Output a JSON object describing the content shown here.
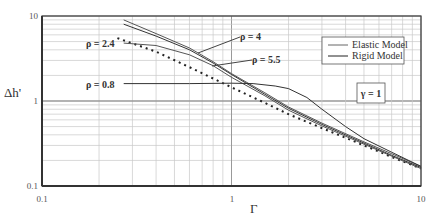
{
  "chart_data": {
    "type": "line",
    "title": "",
    "xlabel": "Γ",
    "ylabel": "Δh'",
    "xscale": "log",
    "yscale": "log",
    "xlim": [
      0.1,
      10
    ],
    "ylim": [
      0.1,
      10
    ],
    "grid": true,
    "x_ticks": [
      "0.1",
      "1",
      "10"
    ],
    "y_ticks": [
      "0.1",
      "1",
      "10"
    ],
    "legend": {
      "position": "upper right",
      "entries": [
        "Elastic Model",
        "Rigid Model"
      ]
    },
    "annotations": [
      "ρ = 4",
      "ρ = 5.5",
      "ρ = 2.4",
      "ρ = 0.8",
      "γ = 1"
    ],
    "series": [
      {
        "name": "Rigid Model",
        "style": "dotted",
        "x": [
          0.25,
          0.4,
          0.6,
          1.0,
          1.5,
          2.0,
          3.0,
          5.0,
          7.0,
          10.0
        ],
        "y": [
          5.5,
          3.8,
          2.5,
          1.45,
          0.95,
          0.7,
          0.48,
          0.3,
          0.22,
          0.16
        ]
      },
      {
        "name": "Elastic Model ρ = 5.5",
        "style": "solid",
        "x": [
          0.27,
          0.4,
          0.6,
          0.8,
          1.0,
          1.5,
          2.0,
          3.0,
          5.0,
          7.0,
          10.0
        ],
        "y": [
          9.0,
          6.2,
          4.2,
          2.9,
          2.1,
          1.25,
          0.85,
          0.55,
          0.33,
          0.24,
          0.17
        ]
      },
      {
        "name": "Elastic Model ρ = 4",
        "style": "solid",
        "x": [
          0.27,
          0.4,
          0.6,
          0.8,
          1.0,
          1.5,
          2.0,
          3.0,
          5.0,
          7.0,
          10.0
        ],
        "y": [
          8.0,
          5.8,
          4.0,
          2.8,
          2.05,
          1.2,
          0.82,
          0.53,
          0.32,
          0.23,
          0.165
        ]
      },
      {
        "name": "Elastic Model ρ = 2.4",
        "style": "solid",
        "x": [
          0.27,
          0.4,
          0.6,
          0.8,
          1.0,
          1.5,
          2.0,
          3.0,
          5.0,
          7.0,
          10.0
        ],
        "y": [
          4.8,
          4.5,
          3.5,
          2.6,
          1.9,
          1.15,
          0.78,
          0.51,
          0.31,
          0.225,
          0.16
        ]
      },
      {
        "name": "Elastic Model ρ = 0.8",
        "style": "solid",
        "x": [
          0.27,
          0.6,
          1.0,
          1.3,
          1.7,
          2.0,
          2.5,
          3.0,
          4.0,
          5.0,
          7.0,
          10.0
        ],
        "y": [
          1.6,
          1.6,
          1.62,
          1.6,
          1.5,
          1.4,
          1.1,
          0.8,
          0.5,
          0.36,
          0.25,
          0.17
        ]
      }
    ]
  },
  "labels": {
    "ylabel": "Δh'",
    "xlabel": "Γ",
    "x_ticks": [
      "0.1",
      "1",
      "10"
    ],
    "y_ticks": [
      "10",
      "1",
      "0.1"
    ],
    "legend_elastic": "Elastic Model",
    "legend_rigid": "Rigid Model",
    "gamma_box": "γ = 1",
    "rho4": "ρ = 4",
    "rho55": "ρ = 5.5",
    "rho24": "ρ = 2.4",
    "rho08": "ρ = 0.8"
  }
}
